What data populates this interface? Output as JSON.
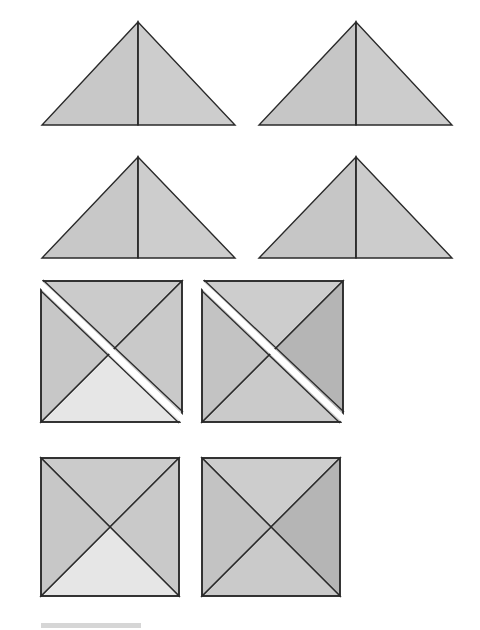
{
  "colors": {
    "stroke": "#2a2a2a",
    "medium": "#c9c9c9",
    "light": "#e4e4e4",
    "dark": "#b3b3b3",
    "gap": "#ffffff",
    "bar": "#d6d6d6"
  },
  "triangles": [
    {
      "name": "triangle-top-left",
      "apex": [
        138,
        22
      ],
      "base": [
        [
          42,
          125
        ],
        [
          235,
          125
        ]
      ],
      "left_fill": "#c8c8c8",
      "right_fill": "#cdcdcd"
    },
    {
      "name": "triangle-top-right",
      "apex": [
        356,
        22
      ],
      "base": [
        [
          259,
          125
        ],
        [
          452,
          125
        ]
      ],
      "left_fill": "#c6c6c6",
      "right_fill": "#cccccc"
    },
    {
      "name": "triangle-middle-left",
      "apex": [
        138,
        157
      ],
      "base": [
        [
          42,
          258
        ],
        [
          235,
          258
        ]
      ],
      "left_fill": "#c8c8c8",
      "right_fill": "#cdcdcd"
    },
    {
      "name": "triangle-middle-right",
      "apex": [
        356,
        157
      ],
      "base": [
        [
          259,
          258
        ],
        [
          452,
          258
        ]
      ],
      "left_fill": "#c6c6c6",
      "right_fill": "#cccccc"
    }
  ],
  "split_squares": [
    {
      "name": "split-square-left",
      "x": 41,
      "y": 281,
      "size": 141,
      "top": "#cbcbcb",
      "right": "#c9c9c9",
      "bottom": "#e6e6e6",
      "left": "#c7c7c7"
    },
    {
      "name": "split-square-right",
      "x": 202,
      "y": 281,
      "size": 141,
      "top": "#cdcdcd",
      "right": "#b5b5b5",
      "bottom": "#cacaca",
      "left": "#c3c3c3"
    }
  ],
  "squares": [
    {
      "name": "square-left",
      "x": 41,
      "y": 458,
      "size": 138,
      "top": "#cbcbcb",
      "right": "#c9c9c9",
      "bottom": "#e6e6e6",
      "left": "#c7c7c7"
    },
    {
      "name": "square-right",
      "x": 202,
      "y": 458,
      "size": 138,
      "top": "#cdcdcd",
      "right": "#b5b5b5",
      "bottom": "#cacaca",
      "left": "#c3c3c3"
    }
  ],
  "footer_bar": {
    "x": 41,
    "y": 623,
    "width": 100,
    "height": 5
  }
}
